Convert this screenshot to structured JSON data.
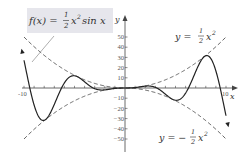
{
  "chart_data": {
    "type": "line",
    "xlabel": "x",
    "ylabel": "y",
    "xlim": [
      -10,
      10
    ],
    "ylim": [
      -55,
      60
    ],
    "x_tick_labels": [
      "-10",
      "10"
    ],
    "y_tick_labels": [
      "50",
      "40",
      "30",
      "20",
      "10",
      "-10",
      "-20",
      "-30",
      "-40",
      "-50"
    ],
    "grid": false,
    "series": [
      {
        "name": "f(x) = 1/2 x^2 sin x",
        "style": "solid",
        "expression": "0.5*x^2*sin(x)",
        "domain": [
          -10.3,
          10.3
        ]
      },
      {
        "name": "y = 1/2 x^2",
        "style": "dashed",
        "expression": "0.5*x^2",
        "domain": [
          -10,
          10
        ]
      },
      {
        "name": "y = -1/2 x^2",
        "style": "dashed",
        "expression": "-0.5*x^2",
        "domain": [
          -10,
          10
        ]
      }
    ],
    "annotations": [
      {
        "text": "f(x) = 1/2 x^2 sin x",
        "position": "top-left boxed"
      },
      {
        "text": "y = 1/2 x^2",
        "position": "top-right"
      },
      {
        "text": "y = -1/2 x^2",
        "position": "bottom-right"
      }
    ]
  },
  "labels": {
    "f_label": "f(x) =",
    "f_tail": "x",
    "sin_x": "sin x",
    "upper_label_prefix": "y =",
    "lower_label_prefix": "y = −",
    "half_num": "1",
    "half_den": "2",
    "x_var": "x",
    "sq": "2",
    "x_axis": "x",
    "y_axis": "y"
  },
  "colors": {
    "curve": "#222222",
    "dashed": "#555555",
    "axis": "#444444",
    "label_box": "#e6e6ec"
  }
}
